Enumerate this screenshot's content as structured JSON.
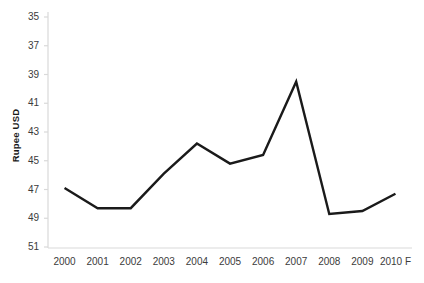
{
  "chart_data": {
    "type": "line",
    "title": "",
    "subtitle": "",
    "xlabel": "",
    "ylabel": "Rupee USD",
    "categories": [
      "2000",
      "2001",
      "2002",
      "2003",
      "2004",
      "2005",
      "2006",
      "2007",
      "2008",
      "2009",
      "2010 F"
    ],
    "values": [
      46.9,
      48.3,
      48.3,
      45.9,
      43.8,
      45.2,
      44.6,
      39.5,
      48.7,
      48.5,
      47.3
    ],
    "series": [
      {
        "name": "Rupee USD",
        "values": [
          46.9,
          48.3,
          48.3,
          45.9,
          43.8,
          45.2,
          44.6,
          39.5,
          48.7,
          48.5,
          47.3
        ]
      }
    ],
    "ylim": [
      35,
      51
    ],
    "y_inverted": true,
    "y_ticks": [
      35,
      37,
      39,
      41,
      43,
      45,
      47,
      49,
      51
    ],
    "y_tick_labels": [
      "35",
      "37",
      "39",
      "41",
      "43",
      "45",
      "47",
      "49",
      "51"
    ],
    "grid": false,
    "legend": false,
    "legend_position": "none",
    "line_color": "#1a1a1a",
    "line_width": 2.4,
    "markers": false,
    "axis_color": "#d9d9d9",
    "background_color": "#ffffff"
  },
  "axes": {
    "y_title": "Rupee USD"
  }
}
